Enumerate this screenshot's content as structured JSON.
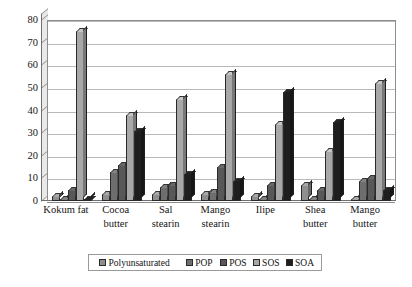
{
  "chart_data": {
    "type": "bar",
    "title": "",
    "xlabel": "",
    "ylabel": "",
    "ylim": [
      0,
      80
    ],
    "ytick_step": 10,
    "yticks": [
      0,
      10,
      20,
      30,
      40,
      50,
      60,
      70,
      80
    ],
    "grid": true,
    "legend_position": "bottom",
    "categories": [
      "Kokum fat",
      "Cocoa butter",
      "Sal stearin",
      "Mango stearin",
      "Ilipe",
      "Shea butter",
      "Mango butter"
    ],
    "series": [
      {
        "name": "Polyunsaturated",
        "color": "#8f8f8f",
        "values": [
          2,
          3,
          3,
          3,
          2,
          7,
          1
        ]
      },
      {
        "name": "POP",
        "color": "#6e6e6e",
        "values": [
          1,
          13,
          6,
          4,
          1,
          1,
          9
        ]
      },
      {
        "name": "POS",
        "color": "#585858",
        "values": [
          5,
          16,
          7,
          15,
          7,
          5,
          10
        ]
      },
      {
        "name": "SOS",
        "color": "#a8a8a8",
        "values": [
          75,
          38,
          45,
          56,
          34,
          22,
          52
        ]
      },
      {
        "name": "SOA",
        "color": "#1e1e1e",
        "values": [
          1,
          31,
          12,
          9,
          48,
          35,
          5
        ]
      }
    ],
    "series_secondary_note": "",
    "colors": {
      "plot_background": "#ffffff",
      "gridline": "#b9b9b9",
      "axis": "#6f6f6f",
      "wall": "#e9e9e9",
      "text": "#151515",
      "legend_border": "#9a9a9a"
    }
  },
  "legend": {
    "items": [
      "Polyunsaturated",
      "POP",
      "POS",
      "SOS",
      "SOA"
    ]
  }
}
